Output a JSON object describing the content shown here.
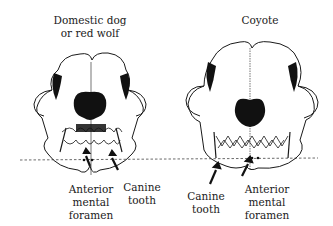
{
  "figure": {
    "left_panel": {
      "title_line1": "Domestic dog",
      "title_line2": "or red wolf",
      "labels": {
        "foramen_line1": "Anterior",
        "foramen_line2": "mental",
        "foramen_line3": "foramen",
        "canine_line1": "Canine",
        "canine_line2": "tooth"
      }
    },
    "right_panel": {
      "title": "Coyote",
      "labels": {
        "canine_line1": "Canine",
        "canine_line2": "tooth",
        "foramen_line1": "Anterior",
        "foramen_line2": "mental",
        "foramen_line3": "foramen"
      }
    },
    "reference_line": "dashed horizontal line through lower jaws",
    "colors": {
      "ink": "#1a1a1a",
      "background": "#ffffff"
    }
  }
}
